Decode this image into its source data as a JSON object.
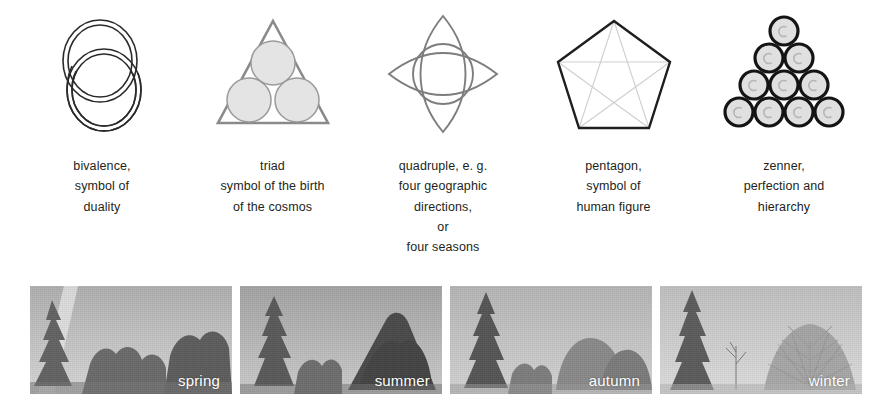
{
  "symbols": [
    {
      "id": "bivalence",
      "icon": "two-interlocking-rings-icon",
      "caption_lines": [
        "bivalence,",
        "symbol of",
        "duality"
      ]
    },
    {
      "id": "triad",
      "icon": "triangle-with-three-circles-icon",
      "caption_lines": [
        "triad",
        "symbol of the birth",
        "of the cosmos"
      ]
    },
    {
      "id": "quadruple",
      "icon": "four-petal-vesica-circle-icon",
      "caption_lines": [
        "quadruple, e. g.",
        "four geographic",
        "directions,",
        "or",
        "four seasons"
      ]
    },
    {
      "id": "pentagon",
      "icon": "pentagon-with-pentagram-icon",
      "caption_lines": [
        "pentagon,",
        "symbol of",
        "human figure"
      ]
    },
    {
      "id": "zenner",
      "icon": "tetractys-ten-circles-icon",
      "caption_lines": [
        "zenner,",
        "perfection and",
        "hierarchy"
      ]
    }
  ],
  "photos": [
    {
      "id": "spring",
      "label": "spring",
      "sky_top": "#b4b4b4",
      "sky_bottom": "#d6d6d6",
      "foliage": "#6d6d6d"
    },
    {
      "id": "summer",
      "label": "summer",
      "sky_top": "#a8a8a8",
      "sky_bottom": "#c8c8c8",
      "foliage": "#5e5e5e"
    },
    {
      "id": "autumn",
      "label": "autumn",
      "sky_top": "#b8b8b8",
      "sky_bottom": "#d2d2d2",
      "foliage": "#7a7a7a"
    },
    {
      "id": "winter",
      "label": "winter",
      "sky_top": "#c2c2c2",
      "sky_bottom": "#dcdcdc",
      "foliage": "#8c8c8c"
    }
  ],
  "colors": {
    "text": "#231f20",
    "stroke_dark": "#1a1a1a",
    "stroke_mid": "#6e6e6e",
    "stroke_light": "#c9c9c9",
    "fill_gray": "#e2e2e2",
    "label_white": "#ffffff",
    "background": "#ffffff"
  }
}
